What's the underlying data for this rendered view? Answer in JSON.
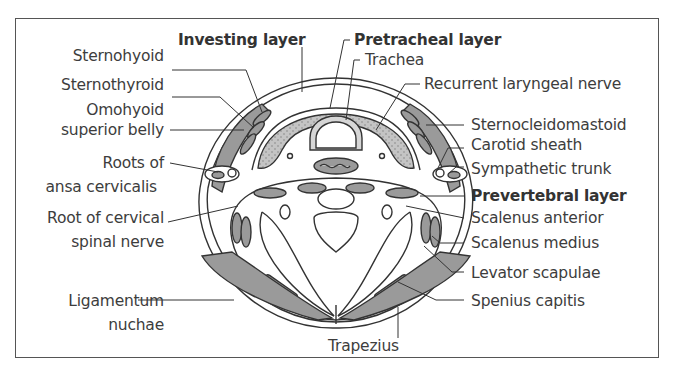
{
  "figure": {
    "labels_left": [
      {
        "id": "sternohyoid",
        "text": "Sternohyoid"
      },
      {
        "id": "sternothyroid",
        "text": "Sternothyroid"
      },
      {
        "id": "omohyoid_1",
        "text": "Omohyoid"
      },
      {
        "id": "omohyoid_2",
        "text": "superior belly"
      },
      {
        "id": "roots_ansa_1",
        "text": "Roots of"
      },
      {
        "id": "roots_ansa_2",
        "text": "ansa cervicalis"
      },
      {
        "id": "root_cervical_1",
        "text": "Root of cervical"
      },
      {
        "id": "root_cervical_2",
        "text": "spinal nerve"
      },
      {
        "id": "ligamentum_1",
        "text": "Ligamentum"
      },
      {
        "id": "ligamentum_2",
        "text": "nuchae"
      }
    ],
    "labels_top": [
      {
        "id": "investing_layer",
        "text": "Investing layer",
        "bold": true
      },
      {
        "id": "pretracheal_layer",
        "text": "Pretracheal layer",
        "bold": true
      },
      {
        "id": "trachea",
        "text": "Trachea"
      }
    ],
    "labels_right": [
      {
        "id": "recurrent_laryngeal_nerve",
        "text": "Recurrent laryngeal nerve"
      },
      {
        "id": "sternocleidomastoid",
        "text": "Sternocleidomastoid"
      },
      {
        "id": "carotid_sheath",
        "text": "Carotid sheath"
      },
      {
        "id": "sympathetic_trunk",
        "text": "Sympathetic trunk"
      },
      {
        "id": "prevertebral_layer",
        "text": "Prevertebral layer",
        "bold": true
      },
      {
        "id": "scalenus_anterior",
        "text": "Scalenus anterior"
      },
      {
        "id": "scalenus_medius",
        "text": "Scalenus medius"
      },
      {
        "id": "levator_scapulae",
        "text": "Levator scapulae"
      },
      {
        "id": "splenius_capitis",
        "text": "Spenius capitis"
      }
    ],
    "labels_bottom": [
      {
        "id": "trapezius",
        "text": "Trapezius"
      }
    ],
    "colors": {
      "muscle_fill": "#9a9a9a",
      "gland_fill": "#c9c9c9",
      "outline": "#333333",
      "background": "#ffffff"
    }
  }
}
